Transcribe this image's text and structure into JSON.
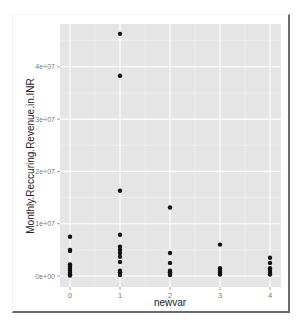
{
  "chart_data": {
    "type": "scatter",
    "title": "",
    "xlabel": "newvar",
    "ylabel": "Monthly.Reccuring.Revenue.in.INR",
    "x_ticks": [
      "0",
      "1",
      "2",
      "3",
      "4"
    ],
    "y_ticks": [
      "0e+00",
      "1e+07",
      "2e+07",
      "3e+07",
      "4e+07"
    ],
    "y_tick_values": [
      0,
      10000000,
      20000000,
      30000000,
      40000000
    ],
    "ylim": [
      -2000000,
      48000000
    ],
    "xlim": [
      -0.2,
      4.2
    ],
    "grid": true,
    "legend": null,
    "points": [
      {
        "x": 0,
        "y": 7500000
      },
      {
        "x": 0,
        "y": 5000000
      },
      {
        "x": 0,
        "y": 4800000
      },
      {
        "x": 0,
        "y": 2200000
      },
      {
        "x": 0,
        "y": 1800000
      },
      {
        "x": 0,
        "y": 1400000
      },
      {
        "x": 0,
        "y": 1000000
      },
      {
        "x": 0,
        "y": 600000
      },
      {
        "x": 0,
        "y": 300000
      },
      {
        "x": 0,
        "y": 100000
      },
      {
        "x": 1,
        "y": 46300000
      },
      {
        "x": 1,
        "y": 38300000
      },
      {
        "x": 1,
        "y": 16300000
      },
      {
        "x": 1,
        "y": 7900000
      },
      {
        "x": 1,
        "y": 5600000
      },
      {
        "x": 1,
        "y": 5000000
      },
      {
        "x": 1,
        "y": 4400000
      },
      {
        "x": 1,
        "y": 3700000
      },
      {
        "x": 1,
        "y": 2700000
      },
      {
        "x": 1,
        "y": 1000000
      },
      {
        "x": 1,
        "y": 700000
      },
      {
        "x": 1,
        "y": 400000
      },
      {
        "x": 1,
        "y": 200000
      },
      {
        "x": 2,
        "y": 13100000
      },
      {
        "x": 2,
        "y": 4400000
      },
      {
        "x": 2,
        "y": 2500000
      },
      {
        "x": 2,
        "y": 1000000
      },
      {
        "x": 2,
        "y": 700000
      },
      {
        "x": 2,
        "y": 400000
      },
      {
        "x": 2,
        "y": 200000
      },
      {
        "x": 3,
        "y": 6000000
      },
      {
        "x": 3,
        "y": 1500000
      },
      {
        "x": 3,
        "y": 1000000
      },
      {
        "x": 3,
        "y": 600000
      },
      {
        "x": 3,
        "y": 300000
      },
      {
        "x": 4,
        "y": 3500000
      },
      {
        "x": 4,
        "y": 2500000
      },
      {
        "x": 4,
        "y": 1500000
      },
      {
        "x": 4,
        "y": 1000000
      },
      {
        "x": 4,
        "y": 600000
      },
      {
        "x": 4,
        "y": 300000
      }
    ],
    "colors": {
      "panel_bg": "#e5e5e5",
      "grid_major": "#ffffff",
      "grid_minor": "#f2f2f2",
      "point": "#111111"
    }
  }
}
